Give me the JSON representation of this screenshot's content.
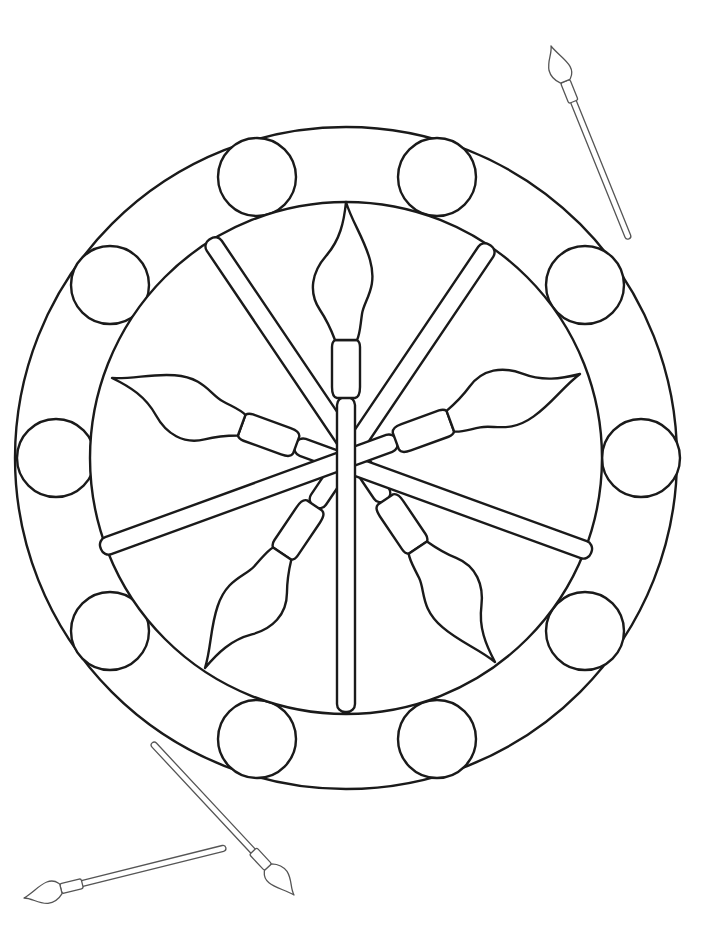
{
  "page": {
    "background": "#ffffff",
    "line_color": "#1a1a1a"
  },
  "mandala": {
    "outer_ring_circles": 10,
    "central_brushes": 5,
    "decorative_brushes": 3
  }
}
